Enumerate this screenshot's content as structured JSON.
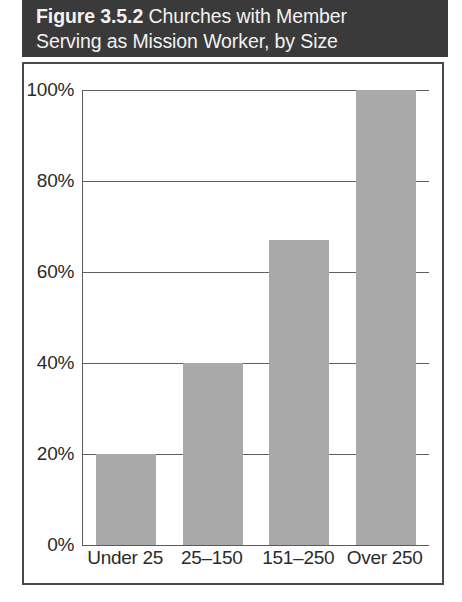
{
  "figure": {
    "number": "Figure 3.5.2",
    "caption": "Churches with Member Serving as Mission Worker, by Size",
    "title_line_1_prefix": "Figure 3.5.2",
    "title_line_1_rest": " Churches with Member",
    "title_line_2": "Serving as Mission Worker, by Size"
  },
  "colors": {
    "title_bar_bg": "#3a3a3a",
    "title_text": "#f2f2f2",
    "bar_fill": "#a9a9a9",
    "axis_line": "#5a5a5a",
    "grid_line": "#5f5f5f",
    "card_border": "#4a4a4a",
    "page_bg": "#ffffff",
    "tick_text": "#2b2b2b"
  },
  "chart_data": {
    "type": "bar",
    "title": "Figure 3.5.2 Churches with Member Serving as Mission Worker, by Size",
    "categories": [
      "Under 25",
      "25–150",
      "151–250",
      "Over 250"
    ],
    "values": [
      20,
      40,
      67,
      100
    ],
    "xlabel": "",
    "ylabel": "",
    "ylim": [
      0,
      100
    ],
    "yticks": [
      0,
      20,
      40,
      60,
      80,
      100
    ],
    "ytick_labels": [
      "0%",
      "20%",
      "40%",
      "60%",
      "80%",
      "100%"
    ],
    "grid": true,
    "grid_axis": "y",
    "legend": false,
    "value_unit": "percent",
    "series": [
      {
        "name": "Churches with member serving as mission worker",
        "values": [
          20,
          40,
          67,
          100
        ]
      }
    ]
  }
}
